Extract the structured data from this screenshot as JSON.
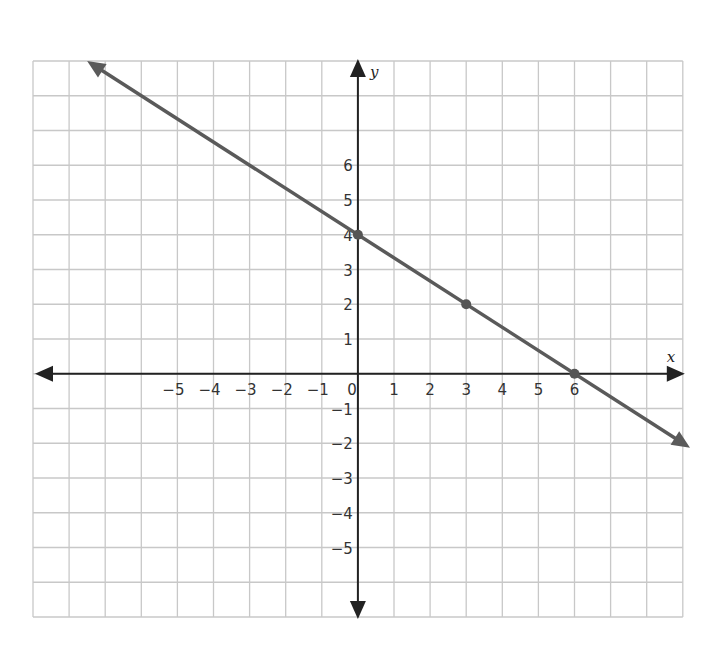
{
  "chart_data": {
    "type": "line",
    "title": "",
    "xlabel": "x",
    "ylabel": "y",
    "xlim": [
      -9,
      9
    ],
    "ylim": [
      -7,
      9
    ],
    "grid": true,
    "x_ticks": [
      -5,
      -4,
      -3,
      -2,
      -1,
      0,
      1,
      2,
      3,
      4,
      5,
      6
    ],
    "y_ticks": [
      -5,
      -4,
      -3,
      -2,
      -1,
      1,
      2,
      3,
      4,
      5,
      6
    ],
    "series": [
      {
        "name": "line",
        "equation": "y = -2/3 x + 4",
        "slope": -0.6667,
        "intercept": 4,
        "x": [
          -7.5,
          9.2
        ],
        "y": [
          9,
          -2.13
        ],
        "arrows_both_ends": true
      }
    ],
    "points": [
      {
        "x": 0,
        "y": 4
      },
      {
        "x": 3,
        "y": 2
      },
      {
        "x": 6,
        "y": 0
      }
    ]
  },
  "colors": {
    "grid": "#c8c8c8",
    "axis": "#222222",
    "line": "#5a5a5a",
    "point": "#555555"
  },
  "layout": {
    "left": 33,
    "top": 61,
    "unit_x": 36.1,
    "unit_y": 34.75,
    "cols": 18,
    "rows": 16,
    "origin_col": 9,
    "origin_row": 9
  }
}
